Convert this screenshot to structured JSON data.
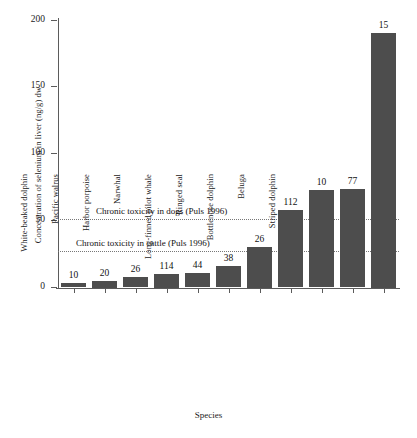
{
  "chart_data": {
    "type": "bar",
    "title": "",
    "xlabel": "Species",
    "ylabel": "Concentration of selenium in liver (ng/g) dw",
    "ylim": [
      0,
      200
    ],
    "yticks": [
      0,
      50,
      100,
      150,
      200
    ],
    "grid": false,
    "legend": "none",
    "bar_color": "#4d4d4d",
    "categories": [
      "Gray whale",
      "Bowhead whale",
      "White-beaked dolphin",
      "Pacific walrus",
      "Harbor porpoise",
      "Narwhal",
      "Long-finned pilot whale",
      "Ringed seal",
      "Bottlenose dolphin",
      "Beluga",
      "Striped dolphin"
    ],
    "values": [
      3,
      5,
      8,
      10,
      11,
      16,
      30,
      58,
      73,
      74,
      190
    ],
    "point_labels": [
      "10",
      "20",
      "26",
      "114",
      "44",
      "38",
      "26",
      "112",
      "10",
      "77",
      "15"
    ],
    "annotations": [
      {
        "text": "Chronic toxicity in dogs (Puls 1996)",
        "y_value": 51,
        "style": "dotted-line"
      },
      {
        "text": "Chronic toxicity in cattle (Puls 1996)",
        "y_value": 27,
        "style": "dotted-line"
      }
    ]
  }
}
